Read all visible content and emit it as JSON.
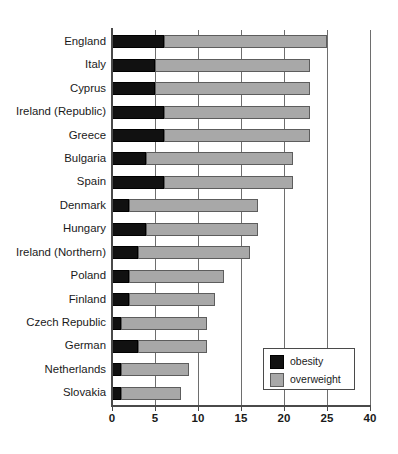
{
  "chart_data": {
    "type": "bar",
    "orientation": "horizontal",
    "stacked": true,
    "title": "",
    "subtitle": "",
    "xlabel": "",
    "ylabel": "",
    "categories": [
      "England",
      "Italy",
      "Cyprus",
      "Ireland (Republic)",
      "Greece",
      "Bulgaria",
      "Spain",
      "Denmark",
      "Hungary",
      "Ireland (Northern)",
      "Poland",
      "Finland",
      "Czech Republic",
      "German",
      "Netherlands",
      "Slovakia"
    ],
    "series": [
      {
        "name": "obesity",
        "color": "#111111",
        "values": [
          6,
          5,
          5,
          6,
          6,
          4,
          6,
          2,
          4,
          3,
          2,
          2,
          1,
          3,
          1,
          1
        ]
      },
      {
        "name": "overweight",
        "color": "#a8a8a8",
        "values": [
          19,
          18,
          18,
          17,
          17,
          17,
          15,
          15,
          13,
          13,
          11,
          10,
          10,
          8,
          8,
          7
        ]
      }
    ],
    "totals": [
      25,
      23,
      23,
      23,
      23,
      21,
      21,
      17,
      17,
      16,
      13,
      12,
      11,
      11,
      9,
      8
    ],
    "xticks": [
      "0",
      "5",
      "10",
      "15",
      "20",
      "25",
      "40"
    ],
    "xtick_positions": [
      0,
      5,
      10,
      15,
      20,
      25,
      30
    ],
    "xlim": [
      0,
      30
    ],
    "grid": true,
    "grid_axis": "x",
    "legend": {
      "position": "bottom-right-inside",
      "entries": [
        {
          "label": "obesity",
          "swatch": "obesity"
        },
        {
          "label": "overweight",
          "swatch": "overweight"
        }
      ]
    }
  }
}
